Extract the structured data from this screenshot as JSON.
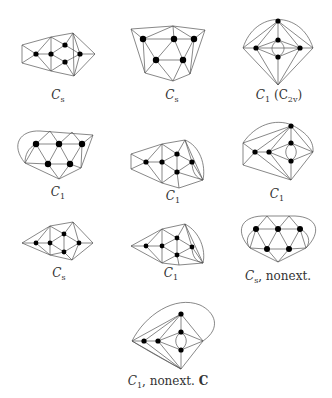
{
  "figure": {
    "panels": [
      {
        "id": "p1",
        "label": "C_s",
        "symmetry": "Cs",
        "extra": ""
      },
      {
        "id": "p2",
        "label": "C_s",
        "symmetry": "Cs",
        "extra": ""
      },
      {
        "id": "p3",
        "label": "C_1 (C_2v)",
        "symmetry": "C1",
        "extra": "(C2v)"
      },
      {
        "id": "p4",
        "label": "C_1",
        "symmetry": "C1",
        "extra": ""
      },
      {
        "id": "p5",
        "label": "C_1",
        "symmetry": "C1",
        "extra": ""
      },
      {
        "id": "p6",
        "label": "C_1",
        "symmetry": "C1",
        "extra": ""
      },
      {
        "id": "p7",
        "label": "C_s",
        "symmetry": "Cs",
        "extra": ""
      },
      {
        "id": "p8",
        "label": "C_1",
        "symmetry": "C1",
        "extra": ""
      },
      {
        "id": "p9",
        "label": "C_s, nonext.",
        "symmetry": "Cs",
        "extra": ", nonext."
      },
      {
        "id": "p10",
        "label": "C_1, nonext. C",
        "symmetry": "C1",
        "extra": ", nonext.",
        "tag": "C"
      }
    ]
  },
  "labels": {
    "p1": {
      "main": "C",
      "sub": "s",
      "tail": ""
    },
    "p2": {
      "main": "C",
      "sub": "s",
      "tail": ""
    },
    "p3": {
      "main": "C",
      "sub": "1",
      "tail": " (C",
      "tail_sub": "2v",
      "tail_end": ")"
    },
    "p4": {
      "main": "C",
      "sub": "1",
      "tail": ""
    },
    "p5": {
      "main": "C",
      "sub": "1",
      "tail": ""
    },
    "p6": {
      "main": "C",
      "sub": "1",
      "tail": ""
    },
    "p7": {
      "main": "C",
      "sub": "s",
      "tail": ""
    },
    "p8": {
      "main": "C",
      "sub": "1",
      "tail": ""
    },
    "p9": {
      "main": "C",
      "sub": "s",
      "tail": ", nonext."
    },
    "p10": {
      "main": "C",
      "sub": "1",
      "tail": ", nonext. ",
      "bold": "C"
    }
  }
}
